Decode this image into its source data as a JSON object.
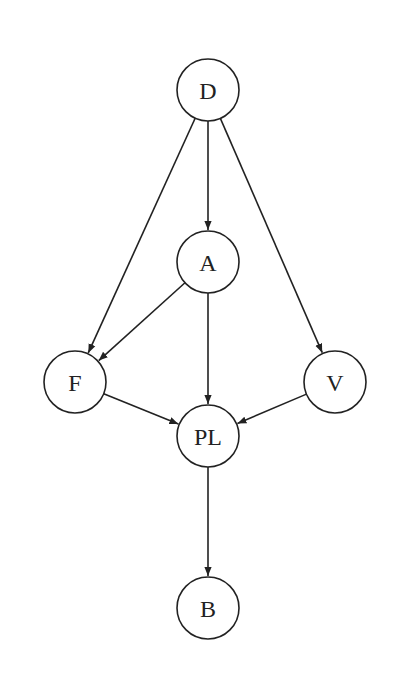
{
  "diagram": {
    "type": "directed-acyclic-graph",
    "nodes": [
      {
        "id": "D",
        "label": "D",
        "x": 208,
        "y": 90
      },
      {
        "id": "A",
        "label": "A",
        "x": 208,
        "y": 262
      },
      {
        "id": "F",
        "label": "F",
        "x": 75,
        "y": 382
      },
      {
        "id": "V",
        "label": "V",
        "x": 335,
        "y": 382
      },
      {
        "id": "PL",
        "label": "PL",
        "x": 208,
        "y": 436
      },
      {
        "id": "B",
        "label": "B",
        "x": 208,
        "y": 608
      }
    ],
    "edges": [
      {
        "from": "D",
        "to": "F"
      },
      {
        "from": "D",
        "to": "A"
      },
      {
        "from": "D",
        "to": "V"
      },
      {
        "from": "A",
        "to": "F"
      },
      {
        "from": "A",
        "to": "PL"
      },
      {
        "from": "F",
        "to": "PL"
      },
      {
        "from": "V",
        "to": "PL"
      },
      {
        "from": "PL",
        "to": "B"
      }
    ],
    "node_radius": 31,
    "stroke_color": "#222222"
  }
}
